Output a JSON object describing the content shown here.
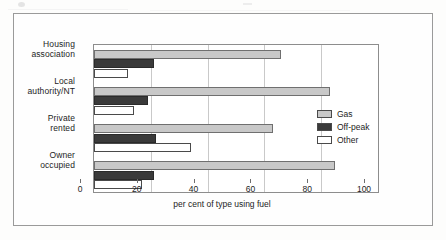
{
  "chart_data": {
    "type": "bar",
    "orientation": "horizontal",
    "title": "",
    "xlabel": "per cent of type using fuel",
    "ylabel": "",
    "xlim": [
      0,
      100
    ],
    "xticks": [
      0,
      20,
      40,
      60,
      80,
      100
    ],
    "grid": "vertical",
    "legend_position": "right-middle",
    "categories": [
      "Housing\nassociation",
      "Local\nauthority/NT",
      "Private\nrented",
      "Owner\noccupied"
    ],
    "category_labels": [
      {
        "line1": "Housing",
        "line2": "association"
      },
      {
        "line1": "Local",
        "line2": "authority/NT"
      },
      {
        "line1": "Private",
        "line2": "rented"
      },
      {
        "line1": "Owner",
        "line2": "occupied"
      }
    ],
    "series": [
      {
        "name": "Gas",
        "color": "#c8c8c8",
        "values": [
          66,
          83,
          63,
          85
        ]
      },
      {
        "name": "Off-peak",
        "color": "#3a3a3a",
        "values": [
          21,
          19,
          22,
          21
        ]
      },
      {
        "name": "Other",
        "color": "#ffffff",
        "values": [
          12,
          14,
          34,
          17
        ]
      }
    ]
  },
  "axis": {
    "tick_labels": [
      "0",
      "20",
      "40",
      "60",
      "80",
      "100"
    ],
    "title": "per cent of type using fuel"
  },
  "legend": {
    "items": [
      {
        "label": "Gas",
        "color": "#c8c8c8"
      },
      {
        "label": "Off-peak",
        "color": "#3a3a3a"
      },
      {
        "label": "Other",
        "color": "#ffffff"
      }
    ]
  }
}
